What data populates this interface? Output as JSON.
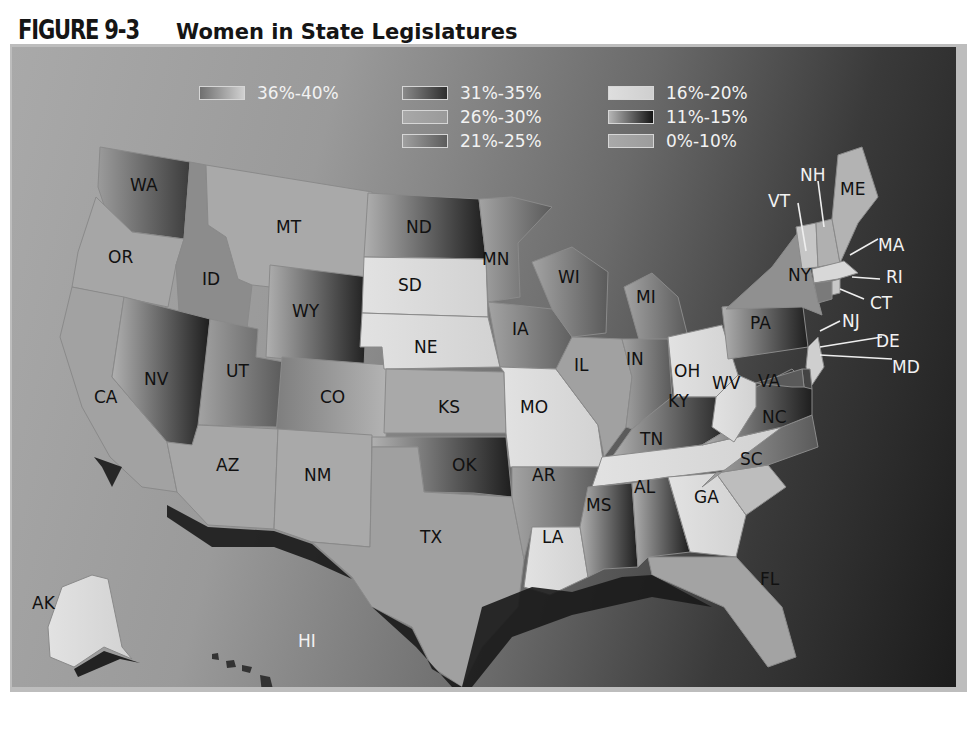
{
  "figure": {
    "number": "FIGURE 9-3",
    "title": "Women in State Legislatures"
  },
  "legend": {
    "items": [
      {
        "label": "36%-40%",
        "swatch": "linear-gradient(90deg,#6f6f6f,#d0d0d0)"
      },
      {
        "label": "31%-35%",
        "swatch": "linear-gradient(90deg,#8a8a8a,#2e2e2e)"
      },
      {
        "label": "26%-30%",
        "swatch": "linear-gradient(90deg,#a8a8a8,#9a9a9a)"
      },
      {
        "label": "21%-25%",
        "swatch": "linear-gradient(90deg,#a0a0a0,#5c5c5c)"
      },
      {
        "label": "16%-20%",
        "swatch": "linear-gradient(90deg,#dedede,#cfcfcf)"
      },
      {
        "label": "11%-15%",
        "swatch": "linear-gradient(90deg,#b5b5b5,#141414)"
      },
      {
        "label": "0%-10%",
        "swatch": "linear-gradient(90deg,#a9a9a9,#9c9c9c)"
      }
    ]
  },
  "states": {
    "WA": "WA",
    "OR": "OR",
    "CA": "CA",
    "ID": "ID",
    "NV": "NV",
    "MT": "MT",
    "WY": "WY",
    "UT": "UT",
    "AZ": "AZ",
    "CO": "CO",
    "NM": "NM",
    "ND": "ND",
    "SD": "SD",
    "NE": "NE",
    "KS": "KS",
    "OK": "OK",
    "TX": "TX",
    "MN": "MN",
    "IA": "IA",
    "MO": "MO",
    "AR": "AR",
    "LA": "LA",
    "WI": "WI",
    "IL": "IL",
    "MI": "MI",
    "IN": "IN",
    "OH": "OH",
    "KY": "KY",
    "TN": "TN",
    "MS": "MS",
    "AL": "AL",
    "GA": "GA",
    "FL": "FL",
    "SC": "SC",
    "NC": "NC",
    "VA": "VA",
    "WV": "WV",
    "PA": "PA",
    "NY": "NY",
    "VT": "VT",
    "NH": "NH",
    "ME": "ME",
    "MA": "MA",
    "RI": "RI",
    "CT": "CT",
    "NJ": "NJ",
    "DE": "DE",
    "MD": "MD",
    "AK": "AK",
    "HI": "HI"
  },
  "map_data": {
    "type": "choropleth",
    "title": "Women in State Legislatures",
    "legend_bins": [
      "36%-40%",
      "31%-35%",
      "26%-30%",
      "21%-25%",
      "16%-20%",
      "11%-15%",
      "0%-10%"
    ],
    "bin_by_state_estimated": {
      "WA": "31%-35%",
      "ND": "11%-15%",
      "WY": "11%-15%",
      "NV": "31%-35%",
      "OK": "11%-15%",
      "KY": "11%-15%",
      "AL": "11%-15%",
      "SD": "16%-20%",
      "NE": "16%-20%",
      "MO": "16%-20%",
      "OH": "16%-20%",
      "WV": "16%-20%",
      "TN": "16%-20%",
      "GA": "16%-20%",
      "AK": "16%-20%",
      "OR": "26%-30%",
      "ID": "21%-25%",
      "MT": "26%-30%",
      "CA": "26%-30%",
      "UT": "21%-25%",
      "CO": "36%-40%",
      "AZ": "26%-30%",
      "NM": "26%-30%",
      "KS": "26%-30%",
      "TX": "21%-25%",
      "MN": "21%-25%",
      "IA": "21%-25%",
      "AR": "21%-25%",
      "LA": "16%-20%",
      "MS": "11%-15%",
      "WI": "21%-25%",
      "IL": "26%-30%",
      "MI": "21%-25%",
      "IN": "21%-25%",
      "PA": "11%-15%",
      "VA": "11%-15%",
      "NC": "21%-25%",
      "SC": "16%-20%",
      "FL": "21%-25%",
      "NY": "21%-25%",
      "ME": "26%-30%",
      "HI": "21%-25%"
    }
  }
}
